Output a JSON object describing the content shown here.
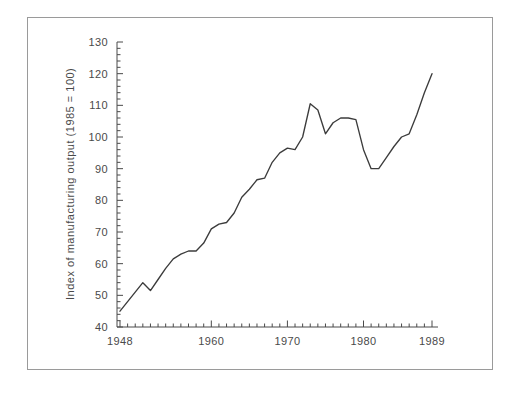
{
  "chart_data": {
    "type": "line",
    "title": "",
    "xlabel": "",
    "ylabel": "Index of manufacturing output (1985 = 100)",
    "xlim": [
      1947.5,
      1989.5
    ],
    "ylim": [
      40,
      130
    ],
    "grid": false,
    "legend": null,
    "y_ticks": [
      40,
      50,
      60,
      70,
      80,
      90,
      100,
      110,
      120,
      130
    ],
    "y_tick_labels": [
      "40",
      "50",
      "60",
      "70",
      "80",
      "90",
      "100",
      "110",
      "120",
      "130"
    ],
    "y_minor_tick_step": 2,
    "x_ticks": [
      1948,
      1949,
      1950,
      1951,
      1952,
      1953,
      1954,
      1955,
      1956,
      1957,
      1958,
      1959,
      1960,
      1961,
      1962,
      1963,
      1964,
      1965,
      1966,
      1967,
      1968,
      1969,
      1970,
      1971,
      1972,
      1973,
      1974,
      1975,
      1976,
      1977,
      1978,
      1979,
      1980,
      1981,
      1982,
      1983,
      1984,
      1985,
      1986,
      1987,
      1988,
      1989
    ],
    "x_tick_labels_shown": [
      "1948",
      "1960",
      "1970",
      "1980",
      "1989"
    ],
    "x_tick_labels_shown_values": [
      1948,
      1960,
      1970,
      1980,
      1989
    ],
    "series": [
      {
        "name": "Index of manufacturing output",
        "x": [
          1948,
          1949,
          1950,
          1951,
          1952,
          1953,
          1954,
          1955,
          1956,
          1957,
          1958,
          1959,
          1960,
          1961,
          1962,
          1963,
          1964,
          1965,
          1966,
          1967,
          1968,
          1969,
          1970,
          1971,
          1972,
          1973,
          1974,
          1975,
          1976,
          1977,
          1978,
          1979,
          1980,
          1981,
          1982,
          1983,
          1984,
          1985,
          1986,
          1987,
          1988,
          1989
        ],
        "y": [
          45.0,
          48.0,
          51.0,
          54.0,
          51.5,
          55.0,
          58.5,
          61.5,
          63.0,
          64.0,
          64.0,
          66.5,
          71.0,
          72.5,
          73.0,
          76.0,
          81.0,
          83.5,
          86.5,
          87.0,
          92.0,
          95.0,
          96.5,
          96.0,
          100.0,
          110.5,
          108.5,
          101.0,
          104.5,
          106.0,
          106.0,
          105.5,
          96.0,
          90.0,
          90.0,
          93.5,
          97.0,
          100.0,
          101.0,
          107.0,
          114.0,
          120.0
        ]
      }
    ]
  },
  "figure": {
    "frame_color": "#9a9a9a",
    "line_color": "#3c3c3c",
    "axis_color": "#4a4a4a",
    "background": "#ffffff"
  }
}
